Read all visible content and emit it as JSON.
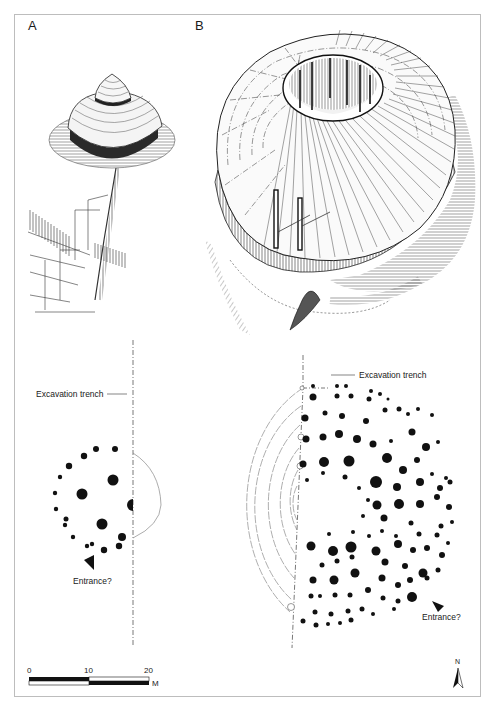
{
  "figure": {
    "panels": [
      {
        "id": "A",
        "label": "A",
        "description": "Isometric reconstruction of small roundhouse with conical thatched roof"
      },
      {
        "id": "B",
        "label": "B",
        "description": "Isometric reconstruction of large ring-shaped building with open central courtyard"
      }
    ],
    "plans": {
      "left": {
        "trench_label": "Excavation trench",
        "entrance_label": "Entrance?"
      },
      "right": {
        "trench_label": "Excavation trench",
        "entrance_label": "Entrance?"
      }
    },
    "scale_bar": {
      "ticks": [
        "0",
        "10",
        "20"
      ],
      "unit": "M"
    },
    "north_arrow": {
      "label": "N"
    },
    "colors": {
      "ink": "#1a1a1a",
      "frame": "#bdbdbd",
      "dashed_line": "#555555",
      "background": "#ffffff"
    }
  }
}
